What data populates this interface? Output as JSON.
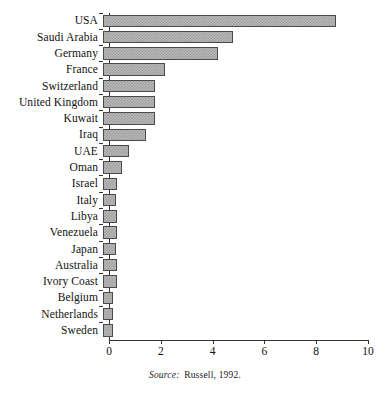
{
  "chart_data": {
    "type": "bar",
    "orientation": "horizontal",
    "title": "",
    "subtitle": "",
    "xlabel": "",
    "ylabel": "",
    "xlim": [
      0,
      10
    ],
    "xticks": [
      0,
      2,
      4,
      6,
      8,
      10
    ],
    "xtick_labels": [
      "0",
      "2",
      "4",
      "6",
      "8",
      "10"
    ],
    "grid": false,
    "legend": false,
    "categories": [
      "USA",
      "Saudi Arabia",
      "Germany",
      "France",
      "Switzerland",
      "United Kingdom",
      "Kuwait",
      "Iraq",
      "UAE",
      "Oman",
      "Israel",
      "Italy",
      "Libya",
      "Venezuela",
      "Japan",
      "Australia",
      "Ivory Coast",
      "Belgium",
      "Netherlands",
      "Sweden"
    ],
    "values": [
      9.0,
      5.0,
      4.45,
      2.4,
      2.0,
      2.0,
      2.0,
      1.65,
      1.0,
      0.75,
      0.55,
      0.5,
      0.55,
      0.55,
      0.5,
      0.55,
      0.55,
      0.4,
      0.4,
      0.4
    ],
    "bar_fill_color": "#b9b9b9",
    "bar_pattern": "checkerboard-dither",
    "bar_edge_color": "#4a4a4a",
    "axis_color": "#333333",
    "background_color": "#ffffff"
  },
  "source_note": {
    "label": "Source:",
    "reference": "Russell, 1992."
  }
}
